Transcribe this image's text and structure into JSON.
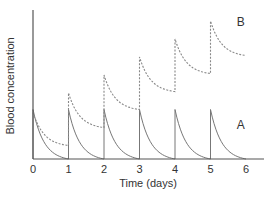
{
  "chart_data": {
    "type": "line",
    "title": "",
    "xlabel": "Time (days)",
    "ylabel": "Blood concentration",
    "xlim": [
      0,
      6.5
    ],
    "ylim": [
      0,
      100
    ],
    "x_ticks": [
      0,
      1,
      2,
      3,
      4,
      5,
      6
    ],
    "x_tick_labels": [
      "0",
      "1",
      "2",
      "3",
      "4",
      "5",
      "6"
    ],
    "y_ticks": [],
    "grid": false,
    "legend": "none (series labelled inline)",
    "series": [
      {
        "name": "A",
        "style": "solid",
        "label_position": {
          "x": 5.85,
          "y": 20
        },
        "description": "Dose given every day; drug fully eliminated before next dose — each peak identical, decays to ~0",
        "points": [
          [
            0,
            33
          ],
          [
            0.25,
            16
          ],
          [
            0.5,
            8
          ],
          [
            0.75,
            3
          ],
          [
            1,
            0
          ],
          [
            1,
            33
          ],
          [
            1.25,
            16
          ],
          [
            1.5,
            8
          ],
          [
            1.75,
            3
          ],
          [
            2,
            0
          ],
          [
            2,
            33
          ],
          [
            2.25,
            16
          ],
          [
            2.5,
            8
          ],
          [
            2.75,
            3
          ],
          [
            3,
            0
          ],
          [
            3,
            33
          ],
          [
            3.25,
            16
          ],
          [
            3.5,
            8
          ],
          [
            3.75,
            3
          ],
          [
            4,
            0
          ],
          [
            4,
            33
          ],
          [
            4.25,
            16
          ],
          [
            4.5,
            8
          ],
          [
            4.75,
            3
          ],
          [
            5,
            0
          ],
          [
            5,
            33
          ],
          [
            5.25,
            16
          ],
          [
            5.5,
            8
          ],
          [
            5.75,
            3
          ],
          [
            6,
            0
          ]
        ]
      },
      {
        "name": "B",
        "style": "dashed",
        "label_position": {
          "x": 5.85,
          "y": 89
        },
        "description": "Dose given every day with slower elimination — drug accumulates, peaks and troughs rise each day",
        "points": [
          [
            0,
            31
          ],
          [
            0.25,
            21
          ],
          [
            0.5,
            15
          ],
          [
            0.75,
            11
          ],
          [
            1,
            9
          ],
          [
            1,
            44
          ],
          [
            1.25,
            34
          ],
          [
            1.5,
            27
          ],
          [
            1.75,
            23
          ],
          [
            2,
            21
          ],
          [
            2,
            56
          ],
          [
            2.25,
            46
          ],
          [
            2.5,
            39
          ],
          [
            2.75,
            35
          ],
          [
            3,
            33
          ],
          [
            3,
            68
          ],
          [
            3.25,
            58
          ],
          [
            3.5,
            51
          ],
          [
            3.75,
            47
          ],
          [
            4,
            45
          ],
          [
            4,
            80
          ],
          [
            4.25,
            70
          ],
          [
            4.5,
            63
          ],
          [
            4.75,
            59
          ],
          [
            5,
            57
          ],
          [
            5,
            92
          ],
          [
            5.25,
            82
          ],
          [
            5.5,
            75
          ],
          [
            5.75,
            71
          ],
          [
            6,
            69
          ]
        ]
      }
    ]
  },
  "plot_area": {
    "x0_px": 33,
    "x_per_unit_px": 35.5,
    "y0_px": 159,
    "y_per_unit_px": 1.5
  },
  "colors": {
    "axis": "#555555",
    "series_a": "#777777",
    "series_b": "#888888",
    "text": "#333333"
  }
}
